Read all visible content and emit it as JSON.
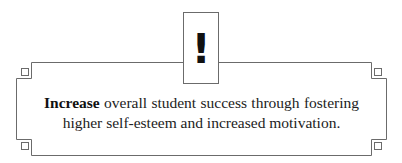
{
  "callout": {
    "icon": "exclamation-icon",
    "icon_glyph": "!",
    "keyword": "Increase",
    "text": " overall student success through fostering higher self-esteem and increased motivation."
  },
  "colors": {
    "border": "#6b6b6b",
    "text": "#222222",
    "background": "#ffffff"
  }
}
